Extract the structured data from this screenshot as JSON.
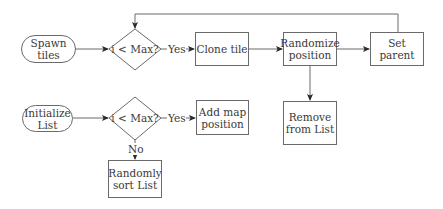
{
  "diagram": {
    "type": "flowchart",
    "colors": {
      "stroke": "#6a6a6a",
      "text": "#3a3a3a",
      "background": "#ffffff"
    },
    "flow1": {
      "start": {
        "line1": "Spawn",
        "line2": "tiles"
      },
      "decision": "i < Max?",
      "yes_label": "Yes",
      "clone": "Clone tile",
      "randomize": {
        "line1": "Randomize",
        "line2": "position"
      },
      "set_parent": "Set parent",
      "remove": {
        "line1": "Remove",
        "line2": "from List"
      }
    },
    "flow2": {
      "start": {
        "line1": "Initialize",
        "line2": "List"
      },
      "decision": "i < Max?",
      "yes_label": "Yes",
      "no_label": "No",
      "add": {
        "line1": "Add map",
        "line2": "position"
      },
      "sort": {
        "line1": "Randomly",
        "line2": "sort List"
      }
    }
  }
}
